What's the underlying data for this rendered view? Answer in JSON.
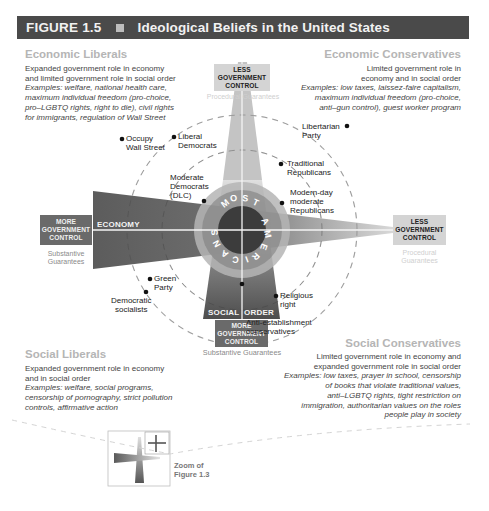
{
  "header": {
    "figure_label": "FIGURE 1.5",
    "title": "Ideological Beliefs in the United States"
  },
  "quadrants": {
    "economic_liberals": {
      "title": "Economic Liberals",
      "description": "Expanded government role in economy and limited government role in social order",
      "examples": "Examples: welfare, national health care, maximum individual freedom (pro-choice, pro–LGBTQ rights, right to die), civil rights for immigrants, regulation of Wall Street",
      "lines": [
        "Expanded government role in economy",
        "and limited government role in social order"
      ],
      "example_lines": [
        "Examples: welfare, national health care,",
        "maximum individual freedom (pro-choice,",
        "pro–LGBTQ rights, right to die), civil rights",
        "for immigrants, regulation of Wall Street"
      ]
    },
    "economic_conservatives": {
      "title": "Economic Conservatives",
      "lines": [
        "Limited government role in",
        "economy and in social order"
      ],
      "example_lines": [
        "Examples: low taxes, laissez-faire capitalism,",
        "maximum individual freedom (pro-choice,",
        "anti–gun control), guest worker program"
      ]
    },
    "social_liberals": {
      "title": "Social Liberals",
      "lines": [
        "Expanded government role in economy",
        "and in social order"
      ],
      "example_lines": [
        "Examples: welfare, social programs,",
        "censorship of pornography, strict pollution",
        "controls, affirmative action"
      ]
    },
    "social_conservatives": {
      "title": "Social Conservatives",
      "lines": [
        "Limited government role in economy and",
        "expanded government role in social order"
      ],
      "example_lines": [
        "Examples: low taxes, prayer in school, censorship",
        "of books that violate traditional values,",
        "anti–LGBTQ rights, tight restriction on",
        "immigration, authoritarian values on the roles",
        "people play in society"
      ]
    }
  },
  "axes": {
    "economy_label": "ECONOMY",
    "social_order_label": "SOCIAL ORDER",
    "social_label": "SOCIAL",
    "order_label": "ORDER",
    "top": {
      "box": [
        "LESS",
        "GOVERNMENT",
        "CONTROL"
      ],
      "guarantee": "Procedural Guarantees"
    },
    "left": {
      "box": [
        "MORE",
        "GOVERNMENT",
        "CONTROL"
      ],
      "guarantee": [
        "Substantive",
        "Guarantees"
      ]
    },
    "right": {
      "box": [
        "LESS",
        "GOVERNMENT",
        "CONTROL"
      ],
      "guarantee": [
        "Procedural",
        "Guarantees"
      ]
    },
    "bottom": {
      "box": [
        "MORE",
        "GOVERNMENT",
        "CONTROL"
      ],
      "guarantee": "Substantive Guarantees"
    }
  },
  "center_label": "MOST AMERICANS",
  "groups": [
    {
      "name": "Occupy Wall Street",
      "lines": [
        "Occupy",
        "Wall Street"
      ]
    },
    {
      "name": "Liberal Democrats",
      "lines": [
        "Liberal",
        "Democrats"
      ]
    },
    {
      "name": "Moderate Democrats (DLC)",
      "lines": [
        "Moderate",
        "Democrats",
        "(DLC)"
      ]
    },
    {
      "name": "Libertarian Party",
      "lines": [
        "Libertarian",
        "Party"
      ]
    },
    {
      "name": "Traditional Republicans",
      "lines": [
        "Traditional",
        "Republicans"
      ]
    },
    {
      "name": "Modern-day moderate Republicans",
      "lines": [
        "Modern-day",
        "moderate",
        "Republicans"
      ]
    },
    {
      "name": "Green Party",
      "lines": [
        "Green",
        "Party"
      ]
    },
    {
      "name": "Democratic socialists",
      "lines": [
        "Democratic",
        "socialists"
      ]
    },
    {
      "name": "Religious right",
      "lines": [
        "Religious",
        "right"
      ]
    },
    {
      "name": "Anti-establishment conservatives",
      "lines": [
        "Anti-establishment",
        "conservatives"
      ]
    }
  ],
  "inset": {
    "label_lines": [
      "Zoom of",
      "Figure 1.3"
    ]
  },
  "colors": {
    "header_bg": "#4a4a4a",
    "dark_box": "#6a6a6a",
    "light_box": "#d4d4d4",
    "title_gray": "#b5b5b5"
  }
}
